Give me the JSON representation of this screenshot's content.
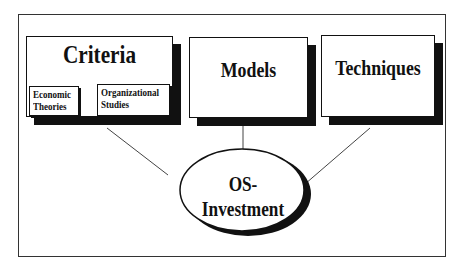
{
  "diagram": {
    "title": "",
    "nodes": [
      {
        "id": "criteria",
        "label": "Criteria",
        "shape": "rectangle-shadow",
        "children": [
          {
            "id": "economic-theories",
            "label_line1": "Economic",
            "label_line2": "Theories"
          },
          {
            "id": "organizational-studies",
            "label_line1": "Organizational",
            "label_line2": "Studies"
          }
        ]
      },
      {
        "id": "models",
        "label": "Models",
        "shape": "rectangle-shadow"
      },
      {
        "id": "techniques",
        "label": "Techniques",
        "shape": "rectangle-shadow"
      },
      {
        "id": "os-investment",
        "label": "OS-Investment",
        "shape": "ellipse-shadow"
      }
    ],
    "edges": [
      {
        "from": "criteria",
        "to": "os-investment"
      },
      {
        "from": "models",
        "to": "os-investment"
      },
      {
        "from": "techniques",
        "to": "os-investment"
      },
      {
        "from": "criteria",
        "to": "economic-theories"
      },
      {
        "from": "criteria",
        "to": "organizational-studies"
      }
    ],
    "colors": {
      "stroke": "#111111",
      "shadow": "#111111",
      "background": "#ffffff"
    }
  }
}
